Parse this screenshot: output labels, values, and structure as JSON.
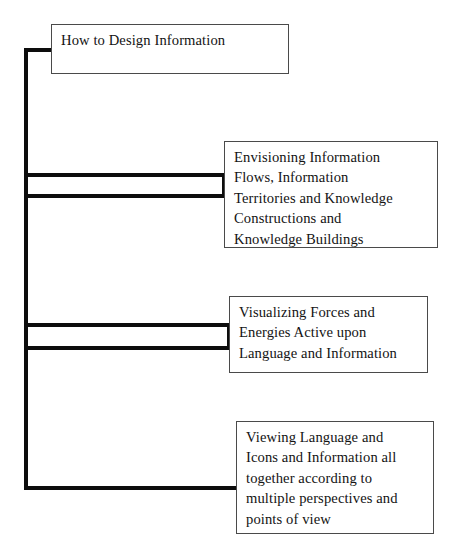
{
  "diagram": {
    "title": "How to Design Information",
    "type": "hierarchy-tree",
    "orientation": "left-trunk-right-branches",
    "background_color": "#ffffff",
    "line_color": "#0d0d0d",
    "box_border_color": "#4a4a4a",
    "text_color": "#131313",
    "root": {
      "id": "node-root",
      "label": "How to Design Information"
    },
    "branches": [
      {
        "id": "node-branch-1",
        "label": "Envisioning Information\nFlows, Information\nTerritories and Knowledge\nConstructions and\nKnowledge Buildings",
        "connector": "double-line-fork"
      },
      {
        "id": "node-branch-2",
        "label": "Visualizing Forces and\nEnergies Active upon\nLanguage and Information",
        "connector": "double-line-fork"
      },
      {
        "id": "node-branch-3",
        "label": "Viewing Language and\nIcons and Information all\ntogether according to\nmultiple perspectives and\npoints of view",
        "connector": "single-line"
      }
    ]
  }
}
